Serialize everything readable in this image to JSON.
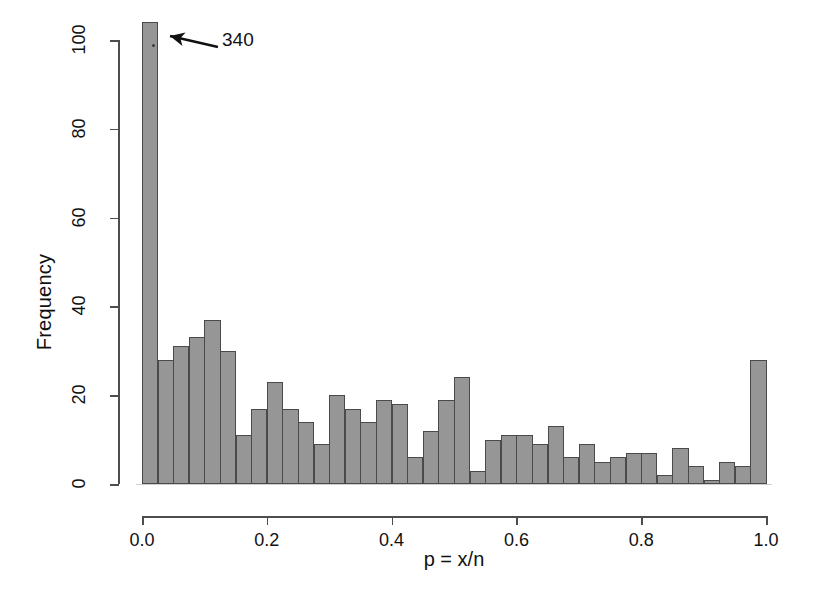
{
  "chart_data": {
    "type": "bar",
    "title": "",
    "subtitle": "",
    "xlabel": "p = x/n",
    "ylabel": "Frequency",
    "xlim": [
      0.0,
      1.0
    ],
    "ylim": [
      0,
      104
    ],
    "grid": false,
    "legend": null,
    "bin_width": 0.025,
    "n_bins": 40,
    "x_ticks": [
      "0.0",
      "0.2",
      "0.4",
      "0.6",
      "0.8",
      "1.0"
    ],
    "x_tick_values": [
      0.0,
      0.2,
      0.4,
      0.6,
      0.8,
      1.0
    ],
    "y_ticks": [
      "0",
      "20",
      "40",
      "60",
      "80",
      "100"
    ],
    "y_tick_values": [
      0,
      20,
      40,
      60,
      80,
      100
    ],
    "categories": [
      "0.000",
      "0.025",
      "0.050",
      "0.075",
      "0.100",
      "0.125",
      "0.150",
      "0.175",
      "0.200",
      "0.225",
      "0.250",
      "0.275",
      "0.300",
      "0.325",
      "0.350",
      "0.375",
      "0.400",
      "0.425",
      "0.450",
      "0.475",
      "0.500",
      "0.525",
      "0.550",
      "0.575",
      "0.600",
      "0.625",
      "0.650",
      "0.675",
      "0.700",
      "0.725",
      "0.750",
      "0.775",
      "0.800",
      "0.825",
      "0.850",
      "0.875",
      "0.900",
      "0.925",
      "0.950",
      "0.975"
    ],
    "values": [
      340,
      28,
      31,
      33,
      37,
      30,
      11,
      17,
      23,
      17,
      14,
      9,
      20,
      17,
      14,
      19,
      18,
      6,
      12,
      19,
      24,
      3,
      10,
      11,
      11,
      9,
      13,
      6,
      9,
      5,
      6,
      7,
      7,
      2,
      8,
      4,
      1,
      5,
      4,
      28
    ],
    "clipped_values": [
      104,
      28,
      31,
      33,
      37,
      30,
      11,
      17,
      23,
      17,
      14,
      9,
      20,
      17,
      14,
      19,
      18,
      6,
      12,
      19,
      24,
      3,
      10,
      11,
      11,
      9,
      13,
      6,
      9,
      5,
      6,
      7,
      7,
      2,
      8,
      4,
      1,
      5,
      4,
      28
    ],
    "annotations": [
      {
        "label": "340",
        "target_bin": "0.000",
        "target_value": 340,
        "note": "first bar truncated; arrow points to clipped bar top"
      }
    ],
    "colors": {
      "bar_fill": "#969696",
      "bar_edge": "#4a4a4a",
      "axis": "#4d4d4d",
      "text": "#111111",
      "background": "#ffffff"
    }
  }
}
